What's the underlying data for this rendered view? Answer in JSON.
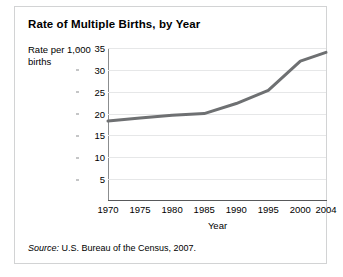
{
  "figure": {
    "title": "Rate of Multiple Births, by Year",
    "source_label": "Source:",
    "source_text": " U.S. Bureau of the Census, 2007.",
    "border_color": "#d2d3d4",
    "background": "#ffffff"
  },
  "chart_data": {
    "type": "line",
    "title": "Rate of Multiple Births, by Year",
    "xlabel": "Year",
    "ylabel": "Rate per 1,000 births",
    "x": [
      1970,
      1975,
      1980,
      1985,
      1990,
      1995,
      2000,
      2004
    ],
    "values": [
      18.3,
      19.0,
      19.6,
      20.0,
      22.3,
      25.3,
      32.0,
      34.0
    ],
    "series": [
      {
        "name": "Rate of multiple births",
        "values": [
          18.3,
          19.0,
          19.6,
          20.0,
          22.3,
          25.3,
          32.0,
          34.0
        ],
        "color": "#6e7072"
      }
    ],
    "xlim": [
      1970,
      2004
    ],
    "ylim": [
      0,
      35
    ],
    "xticks": [
      1970,
      1975,
      1980,
      1985,
      1990,
      1995,
      2000,
      2004
    ],
    "xtick_labels": [
      "1970",
      "1975",
      "1980",
      "1985",
      "1990",
      "1995",
      "2000",
      "2004"
    ],
    "yticks": [
      5,
      10,
      15,
      20,
      25,
      30,
      35
    ],
    "ytick_labels": [
      "5",
      "10",
      "15",
      "20",
      "25",
      "30",
      "35"
    ],
    "grid": "horizontal",
    "grid_color": "#e6e7e8",
    "legend": "none",
    "line_width": 3
  }
}
